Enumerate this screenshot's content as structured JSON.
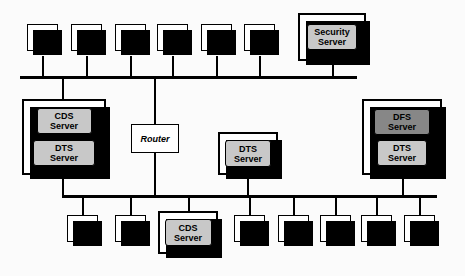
{
  "diagram": {
    "colors": {
      "background": "#fbfbfb",
      "line": "#000000",
      "plate_light": "#c8c8c8",
      "plate_dark": "#878787",
      "chassis": "#ffffff"
    },
    "labels": {
      "ws": "WS",
      "router": "Router",
      "cds_line1": "CDS",
      "cds_line2": "Server",
      "dts_line1": "DTS",
      "dts_line2": "Server",
      "dfs_line1": "DFS",
      "dfs_line2": "Server",
      "security_line1": "Security",
      "security_line2": "Server"
    },
    "segments": [
      {
        "name": "top-bus",
        "nodes": [
          "WS",
          "WS",
          "WS",
          "WS",
          "WS",
          "WS",
          "Security Server"
        ]
      },
      {
        "name": "middle",
        "nodes": [
          "CDS Server / DTS Server",
          "Router",
          "DTS Server",
          "DFS Server / DTS Server"
        ]
      },
      {
        "name": "bottom-bus",
        "nodes": [
          "WS",
          "WS",
          "CDS Server",
          "WS",
          "WS",
          "WS",
          "WS",
          "WS"
        ]
      }
    ]
  }
}
